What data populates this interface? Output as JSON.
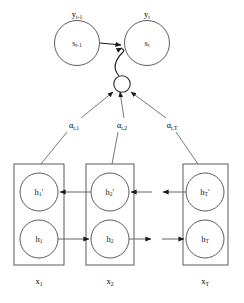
{
  "figure": {
    "background_color": "#ffffff",
    "stroke_color": "#4a4a4a",
    "text_color": "#1a1a1a",
    "width": 244,
    "height": 303
  },
  "decoder": {
    "outputs": [
      {
        "id": "y_prev",
        "base": "y",
        "sub": "t-1"
      },
      {
        "id": "y_cur",
        "base": "y",
        "sub": "t"
      }
    ],
    "states": [
      {
        "id": "s_prev",
        "base": "s",
        "sub": "t-1"
      },
      {
        "id": "s_cur",
        "base": "s",
        "sub": "t"
      }
    ]
  },
  "context": {
    "name": "context-vector-node",
    "label": ""
  },
  "attention": {
    "weights": [
      {
        "id": "alpha_t1",
        "base": "α",
        "sub": "t,1"
      },
      {
        "id": "alpha_t2",
        "base": "α",
        "sub": "t,2"
      },
      {
        "id": "alpha_tT",
        "base": "α",
        "sub": "t,T"
      }
    ]
  },
  "encoder": {
    "timesteps": [
      {
        "index": 0,
        "backward": {
          "base": "h",
          "sub": "1",
          "prime": "′"
        },
        "forward": {
          "base": "h",
          "sub": "1",
          "prime": ""
        },
        "input": {
          "base": "x",
          "sub": "1"
        }
      },
      {
        "index": 1,
        "backward": {
          "base": "h",
          "sub": "2",
          "prime": "′"
        },
        "forward": {
          "base": "h",
          "sub": "2",
          "prime": ""
        },
        "input": {
          "base": "x",
          "sub": "2"
        }
      },
      {
        "index": 2,
        "backward": {
          "base": "h",
          "sub": "T",
          "prime": "′"
        },
        "forward": {
          "base": "h",
          "sub": "T",
          "prime": ""
        },
        "input": {
          "base": "x",
          "sub": "T"
        }
      }
    ]
  }
}
